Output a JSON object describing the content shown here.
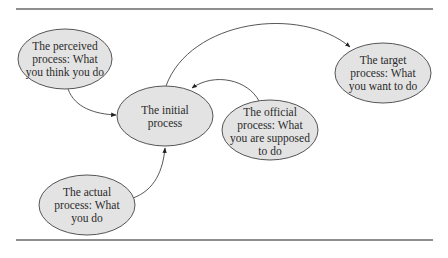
{
  "diagram": {
    "type": "process-relationship",
    "colors": {
      "node_fill": "#e3e3e3",
      "node_stroke": "#555555",
      "edge": "#444444",
      "rule": "#6a6a6a"
    },
    "nodes": [
      {
        "id": "perceived",
        "lines": [
          "The perceived",
          "process:  What",
          "you think you do"
        ]
      },
      {
        "id": "initial",
        "lines": [
          "The initial",
          "process"
        ]
      },
      {
        "id": "official",
        "lines": [
          "The official",
          "process:  What",
          "you are supposed",
          "to do"
        ]
      },
      {
        "id": "target",
        "lines": [
          "The target",
          "process:  What",
          "you want to do"
        ]
      },
      {
        "id": "actual",
        "lines": [
          "The actual",
          "process:  What",
          "you do"
        ]
      }
    ],
    "edges": [
      {
        "from": "perceived",
        "to": "initial"
      },
      {
        "from": "actual",
        "to": "initial"
      },
      {
        "from": "official",
        "to": "initial"
      },
      {
        "from": "initial",
        "to": "target"
      }
    ]
  }
}
